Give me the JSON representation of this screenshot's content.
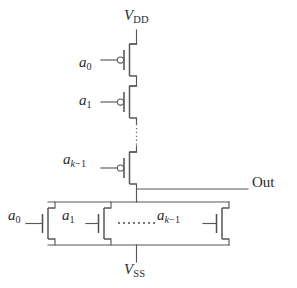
{
  "figure": {
    "name": "cmos-nand-gate-schematic",
    "type": "circuit-diagram",
    "background_color": "#ffffff",
    "line_color": "#58585a",
    "text_color": "#2b2b2d"
  },
  "rails": {
    "supply": {
      "symbol": "V",
      "subscript": "DD",
      "text": "VDD"
    },
    "ground": {
      "symbol": "V",
      "subscript": "SS",
      "text": "VSS"
    }
  },
  "output": {
    "label": "Out"
  },
  "pull_up_network": {
    "device_type": "PMOS",
    "topology": "series",
    "transistors": [
      {
        "gate_symbol": "a",
        "gate_subscript": "0",
        "gate_label": "a0"
      },
      {
        "gate_symbol": "a",
        "gate_subscript": "1",
        "gate_label": "a1"
      },
      {
        "gate_symbol": "a",
        "gate_subscript": "k-1",
        "gate_label": "ak-1"
      }
    ],
    "ellipsis": "vertical-dotted"
  },
  "pull_down_network": {
    "device_type": "NMOS",
    "topology": "parallel",
    "transistors": [
      {
        "gate_symbol": "a",
        "gate_subscript": "0",
        "gate_label": "a0"
      },
      {
        "gate_symbol": "a",
        "gate_subscript": "1",
        "gate_label": "a1"
      },
      {
        "gate_symbol": "a",
        "gate_subscript": "k-1",
        "gate_label": "ak-1"
      }
    ],
    "ellipsis": "horizontal-dots",
    "ellipsis_dot_count": 8
  },
  "subscripts": {
    "zero": "0",
    "one": "1",
    "k_minus_1_var": "k",
    "k_minus_1_rest": "−1"
  }
}
